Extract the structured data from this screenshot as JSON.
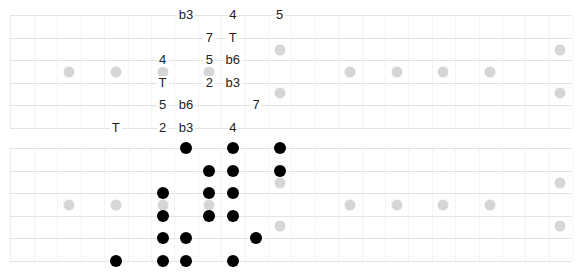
{
  "diagrams": [
    {
      "name": "interval-labels",
      "notes": [
        {
          "string": 1,
          "fret": 8,
          "label": "b3"
        },
        {
          "string": 1,
          "fret": 10,
          "label": "4"
        },
        {
          "string": 1,
          "fret": 12,
          "label": "5"
        },
        {
          "string": 2,
          "fret": 9,
          "label": "7"
        },
        {
          "string": 2,
          "fret": 10,
          "label": "T"
        },
        {
          "string": 3,
          "fret": 7,
          "label": "4"
        },
        {
          "string": 3,
          "fret": 9,
          "label": "5"
        },
        {
          "string": 3,
          "fret": 10,
          "label": "b6"
        },
        {
          "string": 4,
          "fret": 7,
          "label": "T"
        },
        {
          "string": 4,
          "fret": 9,
          "label": "2"
        },
        {
          "string": 4,
          "fret": 10,
          "label": "b3"
        },
        {
          "string": 5,
          "fret": 7,
          "label": "5"
        },
        {
          "string": 5,
          "fret": 8,
          "label": "b6"
        },
        {
          "string": 5,
          "fret": 11,
          "label": "7"
        },
        {
          "string": 6,
          "fret": 5,
          "label": "T"
        },
        {
          "string": 6,
          "fret": 7,
          "label": "2"
        },
        {
          "string": 6,
          "fret": 8,
          "label": "b3"
        },
        {
          "string": 6,
          "fret": 10,
          "label": "4"
        }
      ]
    },
    {
      "name": "note-dots",
      "notes": [
        {
          "string": 1,
          "fret": 8
        },
        {
          "string": 1,
          "fret": 10
        },
        {
          "string": 1,
          "fret": 12
        },
        {
          "string": 2,
          "fret": 9
        },
        {
          "string": 2,
          "fret": 10
        },
        {
          "string": 2,
          "fret": 12
        },
        {
          "string": 3,
          "fret": 7
        },
        {
          "string": 3,
          "fret": 9
        },
        {
          "string": 3,
          "fret": 10
        },
        {
          "string": 4,
          "fret": 7
        },
        {
          "string": 4,
          "fret": 9
        },
        {
          "string": 4,
          "fret": 10
        },
        {
          "string": 5,
          "fret": 7
        },
        {
          "string": 5,
          "fret": 8
        },
        {
          "string": 5,
          "fret": 11
        },
        {
          "string": 6,
          "fret": 5
        },
        {
          "string": 6,
          "fret": 7
        },
        {
          "string": 6,
          "fret": 8
        },
        {
          "string": 6,
          "fret": 10
        }
      ]
    }
  ],
  "fretboard": {
    "strings": 6,
    "frets": 24,
    "single_markers": [
      3,
      5,
      7,
      9,
      15,
      17,
      19,
      21
    ],
    "double_markers": [
      12,
      24
    ]
  },
  "colors": {
    "string": "#e3e3e3",
    "marker": "#d6d6d6",
    "dot": "#000000",
    "label": "#222222"
  }
}
